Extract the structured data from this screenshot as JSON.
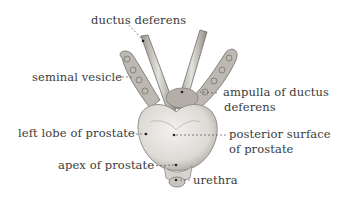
{
  "diagram": {
    "labels": {
      "ductus_deferens": "ductus deferens",
      "seminal_vesicle": "seminal vesicle",
      "ampulla_line1": "ampulla of ductus",
      "ampulla_line2": "deferens",
      "left_lobe": "left lobe of prostate",
      "posterior_line1": "posterior surface",
      "posterior_line2": "of prostate",
      "apex": "apex of prostate",
      "urethra": "urethra"
    },
    "colors": {
      "text": "#3a3a3a",
      "tissue_light": "#e8e6e2",
      "tissue_shade": "#a9a6a0",
      "outline": "#6e6b66"
    }
  }
}
